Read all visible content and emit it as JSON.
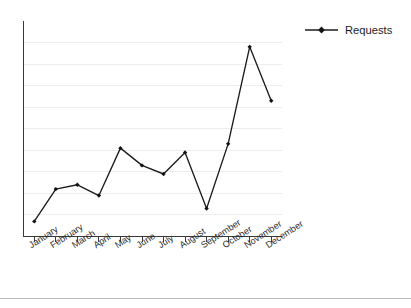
{
  "chart_data": {
    "type": "line",
    "title": "",
    "xlabel": "",
    "ylabel": "",
    "categories": [
      "January",
      "February",
      "March",
      "April",
      "May",
      "June",
      "July",
      "August",
      "September",
      "October",
      "November",
      "December"
    ],
    "series": [
      {
        "name": "Requests",
        "values": [
          7,
          22,
          24,
          19,
          41,
          33,
          29,
          39,
          13,
          43,
          88,
          63
        ]
      }
    ],
    "ylim": [
      0,
      100
    ],
    "y_tick_labels": [],
    "grid": true,
    "gridline_count": 9,
    "legend_position": "top-right",
    "marker": "diamond",
    "x_tick_label_rotation": -33
  },
  "legend": {
    "entries": [
      {
        "label": "Requests",
        "color": "#1d1d1d"
      }
    ]
  },
  "colors": {
    "series": "#1d1d1d",
    "gridline": "#ededed",
    "axis": "#3a3a3a",
    "text": "#222222",
    "background": "#ffffff",
    "footer_rule": "#b9b9b9"
  }
}
